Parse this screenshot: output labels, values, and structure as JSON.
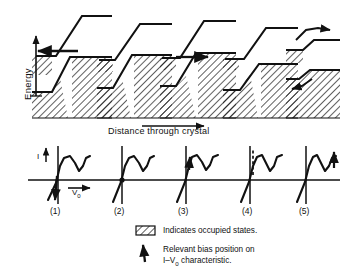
{
  "figure": {
    "ink_color": "#111111",
    "hatch_color": "#111111",
    "background": "#ffffff"
  },
  "axes": {
    "energy_label": "Energy",
    "energy_arrow": "up-arrow",
    "distance_label": "Distance through crystal",
    "distance_arrow": "right-arrow"
  },
  "band_panels": [
    {
      "id": 1,
      "number": "(1)",
      "bias_state": "reverse bias",
      "arrow": "left-arrow",
      "arrow_name": "electron-flow-arrow-left",
      "description": "Reverse bias: electrons tunnel from p-side valence band to n-side conduction band"
    },
    {
      "id": 2,
      "number": "(2)",
      "bias_state": "zero bias",
      "arrow": "none",
      "arrow_name": "no-arrow",
      "description": "Thermal equilibrium, Fermi levels aligned, no net current"
    },
    {
      "id": 3,
      "number": "(3)",
      "bias_state": "forward bias at peak current",
      "arrow": "right-arrow",
      "arrow_name": "electron-flow-arrow-right",
      "description": "Peak tunnelling current, occupied n-states aligned with empty p-states"
    },
    {
      "id": 4,
      "number": "(4)",
      "bias_state": "forward bias at valley current",
      "arrow": "none",
      "arrow_name": "no-arrow",
      "description": "Bands misaligned, tunnelling suppressed, valley current"
    },
    {
      "id": 5,
      "number": "(5)",
      "bias_state": "large forward bias",
      "arrow": "curved-arrows",
      "arrow_name": "thermionic-flow-arrows",
      "description": "Normal diode injection current over the barrier"
    }
  ],
  "iv_panels": [
    {
      "id": 1,
      "number": "(1)",
      "marker_position": "reverse-branch-below-origin",
      "marker_style": "solid"
    },
    {
      "id": 2,
      "number": "(2)",
      "marker_position": "origin-zero-bias",
      "marker_style": "solid"
    },
    {
      "id": 3,
      "number": "(3)",
      "marker_position": "peak-current",
      "marker_style": "solid"
    },
    {
      "id": 4,
      "number": "(4)",
      "marker_position": "negative-resistance-region",
      "marker_style": "dashed"
    },
    {
      "id": 5,
      "number": "(5)",
      "marker_position": "forward-rising-branch",
      "marker_style": "solid"
    }
  ],
  "iv_axis": {
    "current_label": "I",
    "current_arrow": "up-arrow",
    "voltage_label": "V",
    "voltage_subscript": "0",
    "voltage_arrow": "right-arrow"
  },
  "legend": [
    {
      "swatch": "hatched-box",
      "swatch_name": "hatch-swatch",
      "text": "Indicates occupied states."
    },
    {
      "swatch": "bias-marker",
      "swatch_name": "bias-marker-swatch",
      "line1": "Relevant bias position on",
      "line2_prefix": "I",
      "line2_dash": "–",
      "line2_v": "V",
      "line2_sub": "0",
      "line2_suffix": "characteristic."
    }
  ]
}
